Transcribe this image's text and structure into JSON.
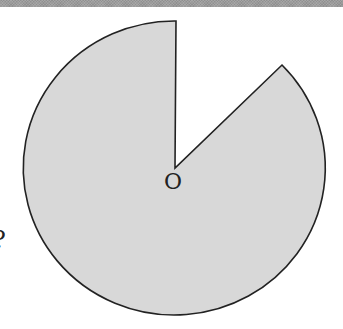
{
  "figure": {
    "type": "circle-sector-diagram",
    "center_label": "O",
    "side_marker": "?",
    "shape": {
      "center": [
        175,
        168
      ],
      "rx": 151,
      "ry": 147,
      "missing_sector": {
        "start_point": [
          176,
          21
        ],
        "end_point": [
          282,
          65
        ],
        "approx_angle_deg": 45
      }
    },
    "colors": {
      "fill": "#d8d8d8",
      "stroke": "#222222",
      "header_band": "#9c9c9c",
      "background": "#ffffff"
    }
  }
}
